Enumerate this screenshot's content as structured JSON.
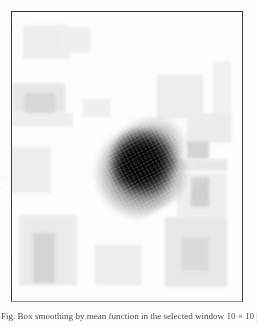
{
  "document": {
    "kind": "scanned-figure-plate",
    "page_background": "#fdfdfd"
  },
  "figure": {
    "frame": {
      "border_color": "#3a3a3a",
      "bottom_border_color": "#8f8f8f",
      "fill_color": "#ffffff",
      "x": 11,
      "y": 11,
      "width": 232,
      "height": 291
    },
    "plate_description": "grayscale raster image: one large dark diffuse blob near the centre surrounded by faint rectangular grey blocks on a white background",
    "dominant_region": {
      "name": "central-dark-blob",
      "center_x": 130,
      "center_y": 154,
      "width": 104,
      "height": 92,
      "rotation_deg": -28,
      "darkness": "near-black",
      "color": "#000000"
    },
    "patches": [
      {
        "name": "patch-top-left-upper",
        "x": 22,
        "y": 24,
        "w": 46,
        "h": 34,
        "gray": "#efefef"
      },
      {
        "name": "patch-top-left-upper-b",
        "x": 60,
        "y": 26,
        "w": 30,
        "h": 26,
        "gray": "#f2f2f2"
      },
      {
        "name": "patch-top-left-lower",
        "x": 12,
        "y": 82,
        "w": 52,
        "h": 30,
        "gray": "#e8e8e8"
      },
      {
        "name": "patch-mid-left-dark",
        "x": 24,
        "y": 92,
        "w": 30,
        "h": 22,
        "gray": "#d8d8d8"
      },
      {
        "name": "patch-left-band",
        "x": 12,
        "y": 112,
        "w": 60,
        "h": 14,
        "gray": "#f0f0f0"
      },
      {
        "name": "patch-left-mid",
        "x": 8,
        "y": 146,
        "w": 42,
        "h": 46,
        "gray": "#f1f1f1"
      },
      {
        "name": "patch-top-right",
        "x": 156,
        "y": 74,
        "w": 46,
        "h": 44,
        "gray": "#eeeeee"
      },
      {
        "name": "patch-right-upper",
        "x": 186,
        "y": 112,
        "w": 44,
        "h": 30,
        "gray": "#ededed"
      },
      {
        "name": "patch-right-mid-dark",
        "x": 186,
        "y": 140,
        "w": 22,
        "h": 18,
        "gray": "#d5d5d5"
      },
      {
        "name": "patch-right-band",
        "x": 168,
        "y": 158,
        "w": 58,
        "h": 12,
        "gray": "#e9e9e9"
      },
      {
        "name": "patch-right-lower-dark",
        "x": 190,
        "y": 176,
        "w": 18,
        "h": 30,
        "gray": "#d2d2d2"
      },
      {
        "name": "patch-right-lower",
        "x": 176,
        "y": 172,
        "w": 50,
        "h": 44,
        "gray": "#f0f0f0"
      },
      {
        "name": "patch-bottom-left",
        "x": 18,
        "y": 214,
        "w": 58,
        "h": 70,
        "gray": "#ececec"
      },
      {
        "name": "patch-bottom-left-dark",
        "x": 32,
        "y": 232,
        "w": 22,
        "h": 50,
        "gray": "#d6d6d6"
      },
      {
        "name": "patch-bottom-center",
        "x": 94,
        "y": 244,
        "w": 46,
        "h": 40,
        "gray": "#eeeeee"
      },
      {
        "name": "patch-bottom-right",
        "x": 164,
        "y": 216,
        "w": 62,
        "h": 70,
        "gray": "#e9e9e9"
      },
      {
        "name": "patch-bottom-right-dark",
        "x": 180,
        "y": 236,
        "w": 28,
        "h": 34,
        "gray": "#dcdcdc"
      },
      {
        "name": "patch-upper-mid",
        "x": 82,
        "y": 98,
        "w": 28,
        "h": 18,
        "gray": "#f2f2f2"
      },
      {
        "name": "patch-right-edge-strip",
        "x": 212,
        "y": 60,
        "w": 18,
        "h": 58,
        "gray": "#f3f3f3"
      }
    ]
  },
  "caption": {
    "text": "Fig. Box smoothing by mean function in the selected window 10 × 10 pixels",
    "truncated": true,
    "note": "only the topmost pixel row of the caption glyphs is inside the screenshot crop"
  }
}
